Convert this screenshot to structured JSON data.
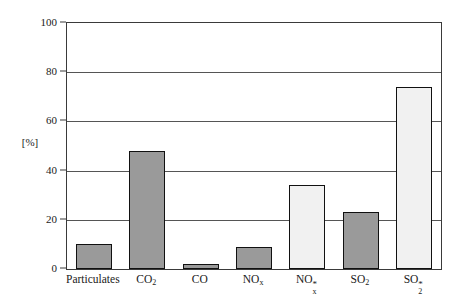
{
  "chart_data": {
    "type": "bar",
    "title": "",
    "xlabel": "",
    "ylabel": "[%]",
    "ylim": [
      0,
      100
    ],
    "yticks": [
      0,
      20,
      40,
      60,
      80,
      100
    ],
    "grid": true,
    "legend": "none",
    "categories": [
      "Particulates",
      "CO2",
      "CO",
      "NOx",
      "NOx*",
      "SO2",
      "SO2*"
    ],
    "category_labels": [
      {
        "base": "Particulates",
        "sub": "",
        "sup": ""
      },
      {
        "base": "CO",
        "sub": "2",
        "sup": ""
      },
      {
        "base": "CO",
        "sub": "",
        "sup": ""
      },
      {
        "base": "NO",
        "sub": "x",
        "sup": ""
      },
      {
        "base": "NO",
        "sub": "x",
        "sup": "*"
      },
      {
        "base": "SO",
        "sub": "2",
        "sup": ""
      },
      {
        "base": "SO",
        "sub": "2",
        "sup": "*"
      }
    ],
    "values": [
      10,
      48,
      2,
      9,
      34,
      23,
      74
    ],
    "bar_styles": [
      "dark",
      "dark",
      "dark",
      "dark",
      "light",
      "dark",
      "light"
    ],
    "colors": {
      "dark_fill": "#9a9a9a",
      "light_fill": "#f1f1f1",
      "bar_border": "#111111",
      "gridline": "#555555",
      "axis": "#3a3a3a",
      "text": "#1a1a1a"
    }
  },
  "axis": {
    "y_unit": "[%]",
    "y_tick_labels": [
      "100",
      "80",
      "60",
      "40",
      "20",
      "0"
    ]
  }
}
